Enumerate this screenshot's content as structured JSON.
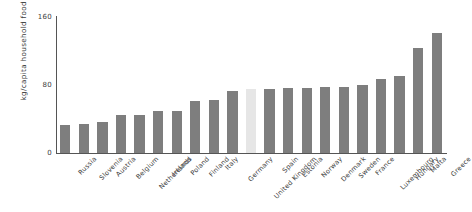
{
  "chart_data": {
    "type": "bar",
    "title": "",
    "subtitle": "",
    "xlabel": "",
    "ylabel": "kg/capita household food waste",
    "ylim": [
      0,
      160
    ],
    "yticks": [
      0,
      80,
      160
    ],
    "ytick_labels": [
      "0",
      "80",
      "160"
    ],
    "grid": false,
    "legend": null,
    "orientation": "vertical",
    "sorted": "ascending",
    "colors": {
      "bar": "#7e7e7e",
      "highlight_bar": "#e6e6e6",
      "axis": "#555555",
      "text": "#3c3c3c",
      "background": "#ffffff"
    },
    "highlighted_category": "United Kingdom",
    "categories": [
      "Russia",
      "Slovenia",
      "Austria",
      "Belgium",
      "Netherlands",
      "Ireland",
      "Poland",
      "Finland",
      "Italy",
      "Germany",
      "United Kingdom",
      "Spain",
      "Estonia",
      "Norway",
      "Denmark",
      "Sweden",
      "France",
      "Luxembourg",
      "Hungary",
      "Malta",
      "Greece"
    ],
    "values": [
      33,
      34,
      37,
      45,
      45,
      50,
      50,
      61,
      62,
      73,
      75,
      75,
      76,
      77,
      78,
      78,
      80,
      87,
      91,
      124,
      141
    ]
  }
}
